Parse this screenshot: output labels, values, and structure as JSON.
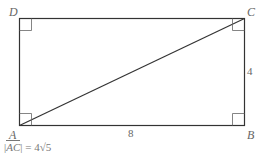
{
  "diagram": {
    "type": "rectangle-with-diagonal",
    "vertices": {
      "A": {
        "label": "A"
      },
      "B": {
        "label": "B"
      },
      "C": {
        "label": "C"
      },
      "D": {
        "label": "D"
      }
    },
    "side_labels": {
      "AB": "8",
      "BC": "4"
    },
    "diagonal": "AC",
    "right_angles": [
      "A",
      "B",
      "C",
      "D"
    ],
    "formula": {
      "open": "|",
      "segment": "AC",
      "close": "|",
      "equals": " = 4√5"
    },
    "colors": {
      "stroke": "#333333",
      "text": "#666666"
    }
  }
}
